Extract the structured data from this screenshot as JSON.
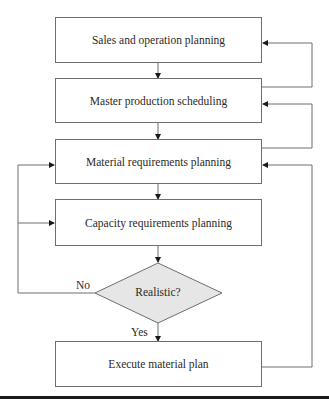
{
  "diagram": {
    "type": "flowchart",
    "nodes": [
      {
        "id": "sop",
        "shape": "rect",
        "label": "Sales and operation planning",
        "lines": [
          "Sales and operation",
          "planning"
        ]
      },
      {
        "id": "mps",
        "shape": "rect",
        "label": "Master production scheduling",
        "lines": [
          "Master production",
          "scheduling"
        ]
      },
      {
        "id": "mrp",
        "shape": "rect",
        "label": "Material requirements planning",
        "lines": [
          "Material requirements",
          "planning"
        ]
      },
      {
        "id": "crp",
        "shape": "rect",
        "label": "Capacity requirements planning",
        "lines": [
          "Capacity requirements",
          "planning"
        ]
      },
      {
        "id": "realistic",
        "shape": "diamond",
        "label": "Realistic?"
      },
      {
        "id": "execute",
        "shape": "rect",
        "label": "Execute material plan",
        "lines": [
          "Execute material",
          "plan"
        ]
      }
    ],
    "edges": [
      {
        "from": "sop",
        "to": "mps"
      },
      {
        "from": "mps",
        "to": "mrp"
      },
      {
        "from": "mrp",
        "to": "crp"
      },
      {
        "from": "crp",
        "to": "realistic"
      },
      {
        "from": "realistic",
        "to": "execute",
        "label": "Yes"
      },
      {
        "from": "realistic",
        "to": "mrp",
        "label": "No"
      },
      {
        "from": "realistic",
        "to": "crp",
        "label": "No"
      },
      {
        "from": "mps",
        "to": "sop",
        "route": "right feedback"
      },
      {
        "from": "mrp",
        "to": "mps",
        "route": "right feedback"
      },
      {
        "from": "execute",
        "to": "mrp",
        "route": "right feedback"
      }
    ],
    "edge_labels": {
      "no": "No",
      "yes": "Yes"
    },
    "colors": {
      "stroke": "#6e6e6e",
      "diamond_fill": "#e6e6e6",
      "rule": "#1a1a1a"
    }
  }
}
